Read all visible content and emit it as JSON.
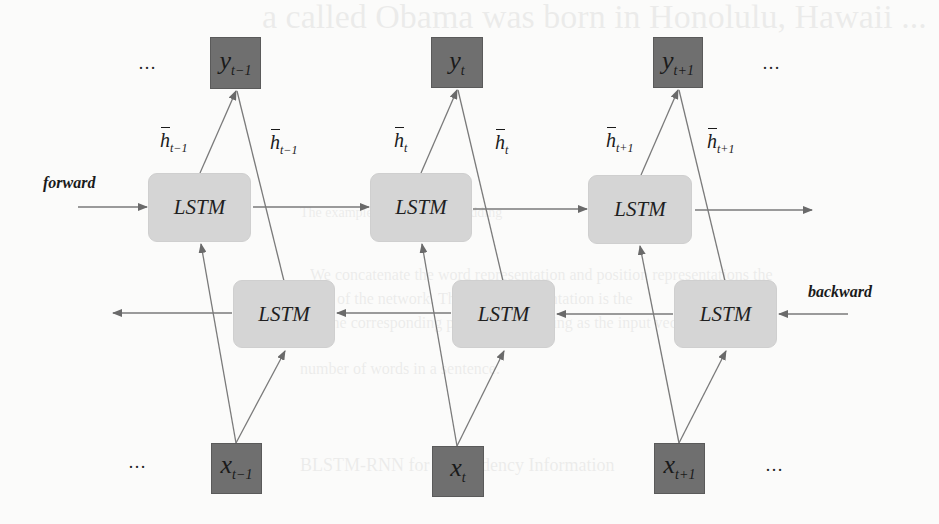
{
  "figure": {
    "direction_labels": {
      "forward": "forward",
      "backward": "backward"
    },
    "ellipsis": "…",
    "outputs": [
      {
        "base": "y",
        "sub": "t−1"
      },
      {
        "base": "y",
        "sub": "t"
      },
      {
        "base": "y",
        "sub": "t+1"
      }
    ],
    "inputs": [
      {
        "base": "x",
        "sub": "t−1"
      },
      {
        "base": "x",
        "sub": "t"
      },
      {
        "base": "x",
        "sub": "t+1"
      }
    ],
    "forward_cells": [
      {
        "label": "LSTM"
      },
      {
        "label": "LSTM"
      },
      {
        "label": "LSTM"
      }
    ],
    "backward_cells": [
      {
        "label": "LSTM"
      },
      {
        "label": "LSTM"
      },
      {
        "label": "LSTM"
      }
    ],
    "hidden_labels": [
      {
        "base": "h",
        "sub": "t−1",
        "arrow": "forward"
      },
      {
        "base": "h",
        "sub": "t−1",
        "arrow": "backward"
      },
      {
        "base": "h",
        "sub": "t",
        "arrow": "forward"
      },
      {
        "base": "h",
        "sub": "t",
        "arrow": "backward"
      },
      {
        "base": "h",
        "sub": "t+1",
        "arrow": "forward"
      },
      {
        "base": "h",
        "sub": "t+1",
        "arrow": "backward"
      }
    ],
    "colors": {
      "io_node": "#6f6f6f",
      "lstm_cell": "#d5d5d5",
      "edge": "#777777",
      "background": "#fbfbfa"
    }
  },
  "background_showthrough": {
    "line1": "a called Obama was born in Honolulu, Hawaii ...",
    "line2": "The example of position embedding",
    "line3": "We concatenate the word representation and position representations the",
    "line4": "input of the network. The word representation is the",
    "line5": "and the corresponding position embedding as the input vector are not",
    "line6": "number of words in a sentence.",
    "line7": "BLSTM-RNN for Dependency Information"
  }
}
